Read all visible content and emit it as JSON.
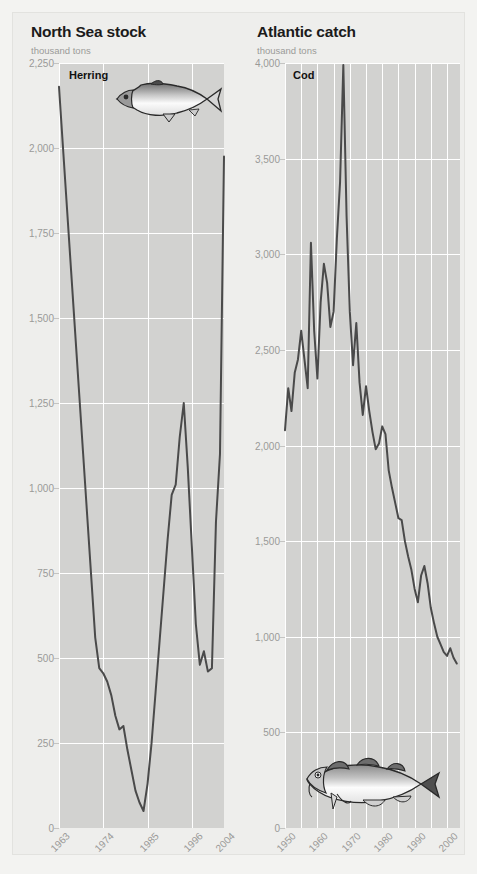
{
  "panels": [
    {
      "id": "north-sea-stock",
      "title": "North Sea stock",
      "unit": "thousand tons",
      "series_label": "Herring",
      "fish_icon": "herring-fish-icon"
    },
    {
      "id": "atlantic-catch",
      "title": "Atlantic catch",
      "unit": "thousand tons",
      "series_label": "Cod",
      "fish_icon": "cod-fish-icon"
    }
  ],
  "colors": {
    "page_background": "#f3f3f1",
    "panel_background": "#eeeeec",
    "plot_background": "#d2d2d0",
    "gridline": "#ffffff",
    "line": "#4a4a4a",
    "title_text": "#1b1b1b",
    "axis_text": "#9a9a98"
  },
  "chart_data": [
    {
      "type": "line",
      "title": "North Sea stock",
      "subtitle": "Herring",
      "xlabel": "",
      "ylabel": "thousand tons",
      "ylim": [
        0,
        2250
      ],
      "yticks": [
        0,
        250,
        500,
        750,
        1000,
        1250,
        1500,
        1750,
        2000,
        2250
      ],
      "ytick_labels": [
        "0",
        "250",
        "500",
        "750",
        "1,000",
        "1,250",
        "1,500",
        "1,750",
        "2,000",
        "2,250"
      ],
      "xlim": [
        1963,
        2004
      ],
      "xticks": [
        1963,
        1974,
        1985,
        1996,
        2004
      ],
      "xtick_labels": [
        "1963",
        "1974",
        "1985",
        "1996",
        "2004"
      ],
      "grid": true,
      "legend": "none",
      "x": [
        1963,
        1964,
        1965,
        1966,
        1967,
        1968,
        1969,
        1970,
        1971,
        1972,
        1973,
        1974,
        1975,
        1976,
        1977,
        1978,
        1979,
        1980,
        1981,
        1982,
        1983,
        1984,
        1985,
        1986,
        1987,
        1988,
        1989,
        1990,
        1991,
        1992,
        1993,
        1994,
        1995,
        1996,
        1997,
        1998,
        1999,
        2000,
        2001,
        2002,
        2003,
        2004
      ],
      "values": [
        2180,
        2000,
        1820,
        1640,
        1460,
        1280,
        1100,
        920,
        740,
        560,
        470,
        455,
        430,
        390,
        330,
        290,
        300,
        230,
        170,
        110,
        75,
        50,
        130,
        250,
        400,
        550,
        700,
        850,
        980,
        1010,
        1150,
        1250,
        1060,
        830,
        600,
        480,
        520,
        460,
        470,
        900,
        1100,
        1975
      ]
    },
    {
      "type": "line",
      "title": "Atlantic catch",
      "subtitle": "Cod",
      "xlabel": "",
      "ylabel": "thousand tons",
      "ylim": [
        0,
        4000
      ],
      "yticks": [
        0,
        500,
        1000,
        1500,
        2000,
        2500,
        3000,
        3500,
        4000
      ],
      "ytick_labels": [
        "0",
        "500",
        "1,000",
        "1,500",
        "2,000",
        "2,500",
        "3,000",
        "3,500",
        "4,000"
      ],
      "xlim": [
        1950,
        2004
      ],
      "xticks": [
        1950,
        1960,
        1970,
        1980,
        1990,
        2000
      ],
      "xtick_labels": [
        "1950",
        "1960",
        "1970",
        "1980",
        "1990",
        "2000"
      ],
      "grid": true,
      "legend": "none",
      "x": [
        1950,
        1951,
        1952,
        1953,
        1954,
        1955,
        1956,
        1957,
        1958,
        1959,
        1960,
        1961,
        1962,
        1963,
        1964,
        1965,
        1966,
        1967,
        1968,
        1969,
        1970,
        1971,
        1972,
        1973,
        1974,
        1975,
        1976,
        1977,
        1978,
        1979,
        1980,
        1981,
        1982,
        1983,
        1984,
        1985,
        1986,
        1987,
        1988,
        1989,
        1990,
        1991,
        1992,
        1993,
        1994,
        1995,
        1996,
        1997,
        1998,
        1999,
        2000,
        2001,
        2002,
        2003
      ],
      "values": [
        2080,
        2300,
        2180,
        2380,
        2450,
        2600,
        2450,
        2300,
        3060,
        2600,
        2350,
        2750,
        2950,
        2850,
        2620,
        2700,
        3080,
        3380,
        3990,
        3200,
        2700,
        2420,
        2640,
        2330,
        2160,
        2310,
        2180,
        2070,
        1980,
        2010,
        2100,
        2060,
        1870,
        1780,
        1700,
        1620,
        1610,
        1500,
        1420,
        1350,
        1250,
        1180,
        1320,
        1370,
        1280,
        1150,
        1070,
        1000,
        960,
        920,
        900,
        940,
        890,
        860
      ]
    }
  ]
}
